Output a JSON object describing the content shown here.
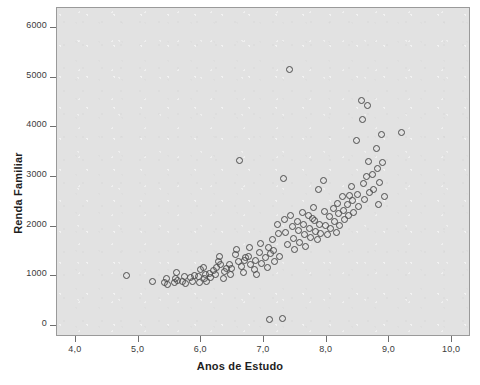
{
  "chart_data": {
    "type": "scatter",
    "title": "",
    "xlabel": "Anos de Estudo",
    "ylabel": "Renda Familiar",
    "xlim": [
      3.7,
      10.3
    ],
    "ylim": [
      -220,
      6400
    ],
    "grid": false,
    "legend": null,
    "xticks": [
      "4,0",
      "5,0",
      "6,0",
      "7,0",
      "8,0",
      "9,0",
      "10,0"
    ],
    "xtick_values": [
      4.0,
      5.0,
      6.0,
      7.0,
      8.0,
      9.0,
      10.0
    ],
    "yticks": [
      "0",
      "1000",
      "2000",
      "3000",
      "4000",
      "5000",
      "6000"
    ],
    "ytick_values": [
      0,
      1000,
      2000,
      3000,
      4000,
      5000,
      6000
    ],
    "marker": "open-circle",
    "marker_color": "#4d4d4d",
    "panel_color": "#e2e2e2",
    "n_points": 131,
    "points": [
      [
        4.8,
        1020
      ],
      [
        5.22,
        900
      ],
      [
        5.4,
        880
      ],
      [
        5.44,
        960
      ],
      [
        5.46,
        840
      ],
      [
        5.56,
        880
      ],
      [
        5.58,
        960
      ],
      [
        5.6,
        1080
      ],
      [
        5.62,
        920
      ],
      [
        5.7,
        900
      ],
      [
        5.72,
        1000
      ],
      [
        5.74,
        860
      ],
      [
        5.82,
        980
      ],
      [
        5.86,
        900
      ],
      [
        5.94,
        1000
      ],
      [
        5.96,
        880
      ],
      [
        5.98,
        1140
      ],
      [
        6.04,
        960
      ],
      [
        6.06,
        1040
      ],
      [
        6.08,
        900
      ],
      [
        6.12,
        1060
      ],
      [
        6.14,
        980
      ],
      [
        6.22,
        1040
      ],
      [
        6.24,
        1180
      ],
      [
        6.26,
        1300
      ],
      [
        6.28,
        1420
      ],
      [
        6.3,
        1240
      ],
      [
        6.34,
        960
      ],
      [
        6.36,
        1100
      ],
      [
        6.44,
        1240
      ],
      [
        6.46,
        1040
      ],
      [
        6.48,
        1160
      ],
      [
        6.54,
        1460
      ],
      [
        6.56,
        1560
      ],
      [
        6.58,
        1300
      ],
      [
        6.6,
        3340
      ],
      [
        6.64,
        1200
      ],
      [
        6.66,
        1080
      ],
      [
        6.68,
        1320
      ],
      [
        6.74,
        1420
      ],
      [
        6.76,
        1600
      ],
      [
        6.78,
        1240
      ],
      [
        6.84,
        1140
      ],
      [
        6.86,
        1320
      ],
      [
        6.88,
        1040
      ],
      [
        6.92,
        1500
      ],
      [
        6.94,
        1680
      ],
      [
        6.96,
        1260
      ],
      [
        7.02,
        1380
      ],
      [
        7.04,
        1180
      ],
      [
        7.06,
        1600
      ],
      [
        7.08,
        150
      ],
      [
        7.12,
        1760
      ],
      [
        7.14,
        1540
      ],
      [
        7.16,
        1300
      ],
      [
        7.2,
        2060
      ],
      [
        7.22,
        1880
      ],
      [
        7.24,
        1420
      ],
      [
        7.28,
        160
      ],
      [
        7.3,
        2980
      ],
      [
        7.32,
        2160
      ],
      [
        7.34,
        1900
      ],
      [
        7.36,
        1660
      ],
      [
        7.4,
        5180
      ],
      [
        7.42,
        2240
      ],
      [
        7.44,
        2020
      ],
      [
        7.46,
        1780
      ],
      [
        7.48,
        1560
      ],
      [
        7.52,
        2120
      ],
      [
        7.54,
        1940
      ],
      [
        7.56,
        1700
      ],
      [
        7.6,
        2300
      ],
      [
        7.62,
        2060
      ],
      [
        7.64,
        1860
      ],
      [
        7.66,
        1620
      ],
      [
        7.7,
        2240
      ],
      [
        7.72,
        1980
      ],
      [
        7.74,
        1800
      ],
      [
        7.78,
        2400
      ],
      [
        7.8,
        2140
      ],
      [
        7.82,
        1920
      ],
      [
        7.84,
        1760
      ],
      [
        7.88,
        2060
      ],
      [
        7.9,
        1880
      ],
      [
        7.94,
        2940
      ],
      [
        7.96,
        2320
      ],
      [
        7.98,
        2040
      ],
      [
        8.0,
        1860
      ],
      [
        8.04,
        2220
      ],
      [
        8.06,
        1980
      ],
      [
        8.1,
        2380
      ],
      [
        8.12,
        2120
      ],
      [
        8.14,
        1900
      ],
      [
        8.18,
        2280
      ],
      [
        8.2,
        2040
      ],
      [
        8.24,
        2620
      ],
      [
        8.26,
        2340
      ],
      [
        8.28,
        2160
      ],
      [
        8.32,
        2460
      ],
      [
        8.34,
        2240
      ],
      [
        8.38,
        2820
      ],
      [
        8.4,
        2540
      ],
      [
        8.42,
        2300
      ],
      [
        8.46,
        3740
      ],
      [
        8.48,
        2660
      ],
      [
        8.5,
        2420
      ],
      [
        8.54,
        4540
      ],
      [
        8.56,
        4160
      ],
      [
        8.58,
        2880
      ],
      [
        8.6,
        2560
      ],
      [
        8.64,
        4440
      ],
      [
        8.66,
        3320
      ],
      [
        8.68,
        2700
      ],
      [
        8.72,
        3060
      ],
      [
        8.74,
        2760
      ],
      [
        8.78,
        3580
      ],
      [
        8.8,
        3180
      ],
      [
        8.82,
        2460
      ],
      [
        8.86,
        3860
      ],
      [
        8.88,
        3300
      ],
      [
        8.92,
        2620
      ],
      [
        9.18,
        3900
      ],
      [
        6.18,
        1120
      ],
      [
        6.4,
        1160
      ],
      [
        6.7,
        1380
      ],
      [
        7.1,
        1480
      ],
      [
        7.76,
        2180
      ],
      [
        8.16,
        2480
      ],
      [
        8.36,
        2640
      ],
      [
        8.62,
        3020
      ],
      [
        8.84,
        2900
      ],
      [
        5.88,
        1020
      ],
      [
        6.02,
        1180
      ],
      [
        7.86,
        2760
      ]
    ]
  }
}
